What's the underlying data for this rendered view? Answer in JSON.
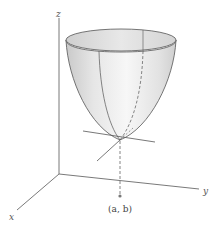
{
  "figure": {
    "axes": {
      "z_label": "z",
      "x_label": "x",
      "y_label": "y"
    },
    "point_label": "(a, b)",
    "colors": {
      "axis": "#6a6a6a",
      "surface_outline": "#555555",
      "surface_fill_light": "#f4f4f4",
      "surface_fill_dark": "#c8c8c8",
      "rim_fill": "#d9d9d9",
      "point": "#777777"
    }
  }
}
